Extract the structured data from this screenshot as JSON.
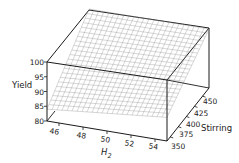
{
  "chart_data": {
    "type": "surface3d",
    "title": "",
    "xlabel": "H2",
    "xlabel_main": "H",
    "xlabel_sub": "2",
    "ylabel": "Stirring",
    "zlabel": "Yield",
    "x_ticks": [
      46,
      48,
      50,
      52,
      54
    ],
    "y_ticks": [
      350,
      375,
      400,
      425,
      450
    ],
    "z_ticks": [
      80,
      85,
      90,
      95,
      100
    ],
    "x_tick_labels": [
      "46",
      "48",
      "50",
      "52",
      "54"
    ],
    "y_tick_labels": [
      "350",
      "375",
      "400",
      "425",
      "450"
    ],
    "z_tick_labels": [
      "80",
      "85",
      "90",
      "95",
      "100"
    ],
    "xlim": [
      45,
      55
    ],
    "ylim": [
      340,
      470
    ],
    "zlim": [
      80,
      100
    ],
    "surface": {
      "description": "Planar response surface, yield increasing with stirring and slightly with H2",
      "corners": [
        {
          "x": 45,
          "y": 340,
          "z": 84
        },
        {
          "x": 55,
          "y": 340,
          "z": 88
        },
        {
          "x": 45,
          "y": 470,
          "z": 100
        },
        {
          "x": 55,
          "y": 470,
          "z": 100
        }
      ],
      "grid_lines_x": 24,
      "grid_lines_y": 22
    },
    "grid": true,
    "legend": null,
    "colors": {
      "surface_mesh": "#8a8a8a",
      "box_edges": "#1a1a1a",
      "background": "#ffffff"
    }
  }
}
